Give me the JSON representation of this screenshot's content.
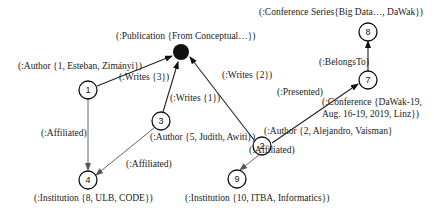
{
  "diagram": {
    "nodes": [
      {
        "id": "pub",
        "number": "",
        "label": "(:Publication {From Conceptual…})",
        "filled": true
      },
      {
        "id": "n1",
        "number": "1",
        "label": "(:Author {1, Esteban, Zimányi})"
      },
      {
        "id": "n3",
        "number": "3",
        "label": "(:Author {5, Judith, Awiti})"
      },
      {
        "id": "n2",
        "number": "2",
        "label": "(:Author {2, Alejandro, Vaisman}"
      },
      {
        "id": "n7",
        "number": "7",
        "label_line1": "(:Conference {DaWak-19,",
        "label_line2": "Aug. 16-19, 2019, Linz})"
      },
      {
        "id": "n8",
        "number": "8",
        "label": "(:Conference Series{Big Data…, DaWak})"
      },
      {
        "id": "n4",
        "number": "4",
        "label": "(:Institution {8, ULB, CODE})"
      },
      {
        "id": "n9",
        "number": "9",
        "label": "(:Institution {10, ITBA, Informatics})"
      }
    ],
    "edges": [
      {
        "from": "n1",
        "to": "pub",
        "label": "(:Writes {3})"
      },
      {
        "from": "n3",
        "to": "pub",
        "label": "(:Writes {1})"
      },
      {
        "from": "n2",
        "to": "pub",
        "label": "(:Writes {2})"
      },
      {
        "from": "n2",
        "to": "n7",
        "label": "(:Presented)"
      },
      {
        "from": "n7",
        "to": "n8",
        "label": "(:BelongsTo)"
      },
      {
        "from": "n1",
        "to": "n4",
        "label": "(:Affiliated)"
      },
      {
        "from": "n3",
        "to": "n4",
        "label": "(:Affiliated)"
      },
      {
        "from": "n2",
        "to": "n9",
        "label": "(:Affiliated)"
      }
    ]
  }
}
